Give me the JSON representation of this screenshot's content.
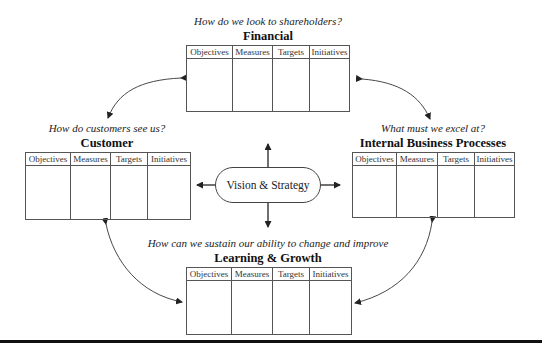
{
  "diagram": {
    "type": "balanced-scorecard",
    "center": {
      "label": "Vision & Strategy"
    },
    "columns": [
      "Objectives",
      "Measures",
      "Targets",
      "Initiatives"
    ],
    "perspectives": {
      "financial": {
        "question": "How do we look to shareholders?",
        "title": "Financial"
      },
      "customer": {
        "question": "How do customers see us?",
        "title": "Customer"
      },
      "internal": {
        "question": "What must we excel at?",
        "title": "Internal Business Processes"
      },
      "learning": {
        "question": "How can we sustain our ability to change and improve",
        "title": "Learning & Growth"
      }
    },
    "colors": {
      "line": "#444444",
      "rule": "#111111",
      "text": "#222222"
    }
  }
}
